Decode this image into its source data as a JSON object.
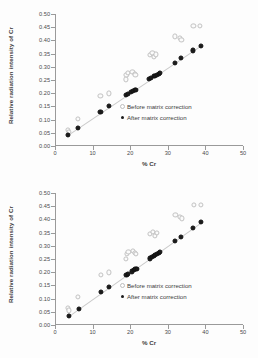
{
  "chart_data": [
    {
      "type": "scatter",
      "title": "",
      "xlabel": "% Cr",
      "ylabel": "Relative radiation intensity of Cr",
      "xlim": [
        0,
        50
      ],
      "ylim": [
        0.0,
        0.5
      ],
      "xticks": [
        0,
        10,
        20,
        30,
        40,
        50
      ],
      "yticks": [
        "0.00",
        "0.05",
        "0.10",
        "0.15",
        "0.20",
        "0.25",
        "0.30",
        "0.35",
        "0.40",
        "0.45",
        "0.50"
      ],
      "grid": false,
      "legend_position": "center-right",
      "series": [
        {
          "name": "Before matrix correction",
          "marker": "open-circle",
          "color": "#c2c2c2",
          "points": [
            [
              3.4,
              0.062
            ],
            [
              3.6,
              0.053
            ],
            [
              6.2,
              0.104
            ],
            [
              12.1,
              0.191
            ],
            [
              14.3,
              0.199
            ],
            [
              18.8,
              0.252
            ],
            [
              19.0,
              0.27
            ],
            [
              19.4,
              0.277
            ],
            [
              20.6,
              0.281
            ],
            [
              21.2,
              0.272
            ],
            [
              21.4,
              0.268
            ],
            [
              25.2,
              0.345
            ],
            [
              25.9,
              0.352
            ],
            [
              26.4,
              0.337
            ],
            [
              26.9,
              0.347
            ],
            [
              31.9,
              0.415
            ],
            [
              33.2,
              0.409
            ],
            [
              33.6,
              0.403
            ],
            [
              36.8,
              0.455
            ],
            [
              38.6,
              0.454
            ]
          ]
        },
        {
          "name": "After matrix correction",
          "marker": "filled-circle",
          "color": "#1b1b1b",
          "points": [
            [
              3.5,
              0.041
            ],
            [
              6.2,
              0.067
            ],
            [
              12.1,
              0.129
            ],
            [
              14.3,
              0.15
            ],
            [
              18.9,
              0.195
            ],
            [
              19.4,
              0.197
            ],
            [
              20.3,
              0.205
            ],
            [
              20.8,
              0.208
            ],
            [
              21.3,
              0.212
            ],
            [
              21.6,
              0.214
            ],
            [
              25.1,
              0.253
            ],
            [
              25.6,
              0.258
            ],
            [
              26.2,
              0.264
            ],
            [
              26.6,
              0.266
            ],
            [
              27.1,
              0.27
            ],
            [
              27.6,
              0.274
            ],
            [
              27.9,
              0.276
            ],
            [
              31.9,
              0.315
            ],
            [
              33.4,
              0.332
            ],
            [
              36.7,
              0.362
            ],
            [
              38.7,
              0.379
            ]
          ]
        }
      ],
      "trendline": {
        "x0": 3.4,
        "y0": 0.041,
        "x1": 38.7,
        "y1": 0.379
      }
    },
    {
      "type": "scatter",
      "title": "",
      "xlabel": "% Cr",
      "ylabel": "Relative radiation intensity of Cr",
      "xlim": [
        0,
        50
      ],
      "ylim": [
        0.0,
        0.5
      ],
      "xticks": [
        0,
        10,
        20,
        30,
        40,
        50
      ],
      "yticks": [
        "0.00",
        "0.05",
        "0.10",
        "0.15",
        "0.20",
        "0.25",
        "0.30",
        "0.35",
        "0.40",
        "0.45",
        "0.50"
      ],
      "grid": false,
      "legend_position": "center-right",
      "series": [
        {
          "name": "Before matrix correction",
          "marker": "open-circle",
          "color": "#c2c2c2",
          "points": [
            [
              3.5,
              0.064
            ],
            [
              3.7,
              0.055
            ],
            [
              6.2,
              0.105
            ],
            [
              12.2,
              0.19
            ],
            [
              14.3,
              0.199
            ],
            [
              18.9,
              0.251
            ],
            [
              19.1,
              0.269
            ],
            [
              19.5,
              0.277
            ],
            [
              20.7,
              0.281
            ],
            [
              21.3,
              0.273
            ],
            [
              21.5,
              0.268
            ],
            [
              25.3,
              0.346
            ],
            [
              26.0,
              0.352
            ],
            [
              26.5,
              0.338
            ],
            [
              27.0,
              0.348
            ],
            [
              32.0,
              0.416
            ],
            [
              33.3,
              0.409
            ],
            [
              33.7,
              0.404
            ],
            [
              36.9,
              0.455
            ],
            [
              38.7,
              0.454
            ]
          ]
        },
        {
          "name": "After matrix correction",
          "marker": "filled-circle",
          "color": "#1b1b1b",
          "points": [
            [
              3.6,
              0.035
            ],
            [
              6.3,
              0.061
            ],
            [
              12.2,
              0.124
            ],
            [
              14.4,
              0.145
            ],
            [
              19.0,
              0.19
            ],
            [
              19.5,
              0.194
            ],
            [
              20.4,
              0.203
            ],
            [
              20.9,
              0.207
            ],
            [
              21.4,
              0.211
            ],
            [
              21.7,
              0.214
            ],
            [
              25.2,
              0.252
            ],
            [
              25.7,
              0.257
            ],
            [
              26.3,
              0.263
            ],
            [
              26.7,
              0.266
            ],
            [
              27.2,
              0.27
            ],
            [
              27.7,
              0.274
            ],
            [
              28.0,
              0.277
            ],
            [
              32.0,
              0.318
            ],
            [
              33.5,
              0.334
            ],
            [
              36.8,
              0.366
            ],
            [
              38.8,
              0.39
            ]
          ]
        }
      ],
      "trendline": {
        "x0": 3.6,
        "y0": 0.035,
        "x1": 38.8,
        "y1": 0.39
      }
    }
  ]
}
